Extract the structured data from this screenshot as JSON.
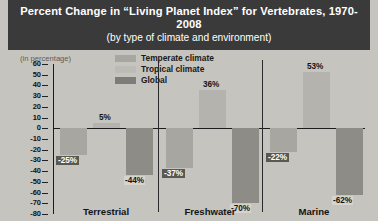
{
  "title": {
    "main": "Percent Change in “Living Planet Index” for Vertebrates, 1970-2008",
    "sub": "(by type of climate and environment)"
  },
  "unit_label": "(in percentage)",
  "legend": [
    {
      "label": "Temperate climate",
      "color": "#a8a6a1",
      "key": "temperate"
    },
    {
      "label": "Tropical climate",
      "color": "#b5b3ae",
      "key": "tropical"
    },
    {
      "label": "Global",
      "color": "#8e8c87",
      "key": "global"
    }
  ],
  "y_ticks": [
    "60",
    "50",
    "40",
    "30",
    "20",
    "10",
    "0",
    "-10",
    "-20",
    "-30",
    "-40",
    "-50",
    "-60",
    "-70",
    "-80"
  ],
  "bar_labels": {
    "terrestrial": {
      "temperate": "-25%",
      "tropical": "5%",
      "global": "-44%"
    },
    "freshwater": {
      "temperate": "-37%",
      "tropical": "36%",
      "global": "-70%"
    },
    "marine": {
      "temperate": "-22%",
      "tropical": "53%",
      "global": "-62%"
    }
  },
  "group_labels": {
    "terrestrial": "Terrestrial",
    "freshwater": "Freshwater",
    "marine": "Marine"
  },
  "chart_data": {
    "type": "bar",
    "title": "Percent Change in “Living Planet Index” for Vertebrates, 1970-2008",
    "subtitle": "(by type of climate and environment)",
    "xlabel": "",
    "ylabel": "(in percentage)",
    "ylim": [
      -80,
      60
    ],
    "ytick_step": 10,
    "grid": false,
    "legend_position": "top-center",
    "categories": [
      "Terrestrial",
      "Freshwater",
      "Marine"
    ],
    "series": [
      {
        "name": "Temperate climate",
        "color": "#a8a6a1",
        "values": [
          -25,
          -37,
          -22
        ]
      },
      {
        "name": "Tropical climate",
        "color": "#b5b3ae",
        "values": [
          5,
          36,
          53
        ]
      },
      {
        "name": "Global",
        "color": "#8e8c87",
        "values": [
          -44,
          -70,
          -62
        ]
      }
    ],
    "data_labels": [
      "-25%",
      "5%",
      "-44%",
      "-37%",
      "36%",
      "-70%",
      "-22%",
      "53%",
      "-62%"
    ]
  }
}
